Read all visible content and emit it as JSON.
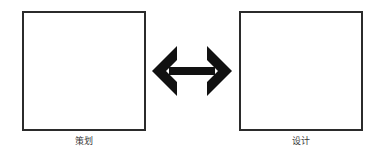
{
  "diagram": {
    "type": "two-node-bidirectional",
    "background_color": "#ffffff",
    "stroke_color": "#2b2b2b",
    "label_color": "#3a3a3a",
    "nodes": [
      {
        "id": "plan",
        "label": "策划",
        "shape": "square",
        "fill": "#ffffff",
        "border_color": "#2b2b2b"
      },
      {
        "id": "design",
        "label": "设计",
        "shape": "square",
        "fill": "#ffffff",
        "border_color": "#2b2b2b"
      }
    ],
    "connector": {
      "id": "bidirectional-arrow",
      "icon": "double-headed-arrow-icon",
      "direction": "horizontal-both",
      "color": "#111111",
      "label": ""
    }
  }
}
